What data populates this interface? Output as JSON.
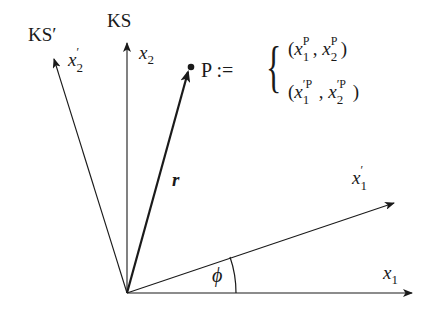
{
  "diagram": {
    "type": "coordinate-rotation",
    "frames": {
      "unprimed": {
        "label": "KS",
        "axis_1": "x",
        "axis_1_sub": "1",
        "axis_2": "x",
        "axis_2_sub": "2"
      },
      "primed": {
        "label": "KS′",
        "axis_1": "x",
        "axis_1_prime": "′",
        "axis_1_sub": "1",
        "axis_2": "x",
        "axis_2_prime": "′",
        "axis_2_sub": "2"
      }
    },
    "vector": {
      "label": "r"
    },
    "angle": {
      "label": "ϕ"
    },
    "point": {
      "name": "P",
      "definition": ":=",
      "coords_unprimed": {
        "open": "(",
        "x1": "x",
        "x1_sup": "P",
        "x1_sub": "1",
        "sep": ",",
        "x2": "x",
        "x2_sup": "P",
        "x2_sub": "2",
        "close": ")"
      },
      "coords_primed": {
        "open": "(",
        "x1": "x",
        "x1_sup": "′P",
        "x1_sub": "1",
        "sep": ",",
        "x2": "x",
        "x2_sup": "′P",
        "x2_sub": "2",
        "close": ")"
      }
    },
    "colors": {
      "ink": "#1a1a1a",
      "background": "#ffffff"
    }
  }
}
